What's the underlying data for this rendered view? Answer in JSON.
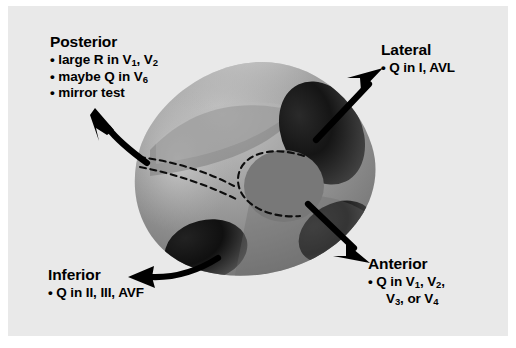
{
  "figure": {
    "background_color": "#e9e9e9",
    "frame_color": "#ffffff",
    "ink_color": "#000000"
  },
  "heart": {
    "name": "left-ventricle-cross-section",
    "body_color": "#8f8f8f",
    "highlight_color": "#c2c2c2",
    "shadow_color": "#141414",
    "cavity_color": "#767676",
    "dashed_line_color": "#111111",
    "shadow_regions": [
      "lateral-wall-shadow",
      "anterior-wall-shadow",
      "inferior-wall-shadow"
    ],
    "cavity_label": "ventricular-cavity"
  },
  "regions": [
    {
      "id": "posterior",
      "heading": "Posterior",
      "bullets": [
        {
          "prefix": "large R in V",
          "sub1": "1",
          "mid": ", V",
          "sub2": "2",
          "suffix": ""
        },
        {
          "prefix": "maybe Q in V",
          "sub1": "6",
          "mid": "",
          "sub2": "",
          "suffix": ""
        },
        {
          "prefix": "mirror test",
          "sub1": "",
          "mid": "",
          "sub2": "",
          "suffix": ""
        }
      ],
      "arrow": "curved-arrow-up-left"
    },
    {
      "id": "lateral",
      "heading": "Lateral",
      "bullets": [
        {
          "prefix": "Q in I, AVL",
          "sub1": "",
          "mid": "",
          "sub2": "",
          "suffix": ""
        }
      ],
      "arrow": "straight-arrow-up-right"
    },
    {
      "id": "anterior",
      "heading": "Anterior",
      "bullets": [
        {
          "prefix": "Q in V",
          "sub1": "1",
          "mid": ", V",
          "sub2": "2",
          "suffix": ","
        },
        {
          "prefix": "V",
          "sub1": "3",
          "mid": ", or V",
          "sub2": "4",
          "suffix": ""
        }
      ],
      "arrow": "straight-arrow-down-right"
    },
    {
      "id": "inferior",
      "heading": "Inferior",
      "bullets": [
        {
          "prefix": "Q in II, III, AVF",
          "sub1": "",
          "mid": "",
          "sub2": "",
          "suffix": ""
        }
      ],
      "arrow": "curved-arrow-left"
    }
  ],
  "text": {
    "posterior_heading": "Posterior",
    "posterior_b1a": "large R in V",
    "posterior_b1s1": "1",
    "posterior_b1m": ", V",
    "posterior_b1s2": "2",
    "posterior_b2a": "maybe Q in V",
    "posterior_b2s1": "6",
    "posterior_b3": "mirror test",
    "lateral_heading": "Lateral",
    "lateral_b1": "Q in I, AVL",
    "anterior_heading": "Anterior",
    "anterior_b1a": "Q in V",
    "anterior_b1s1": "1",
    "anterior_b1m": ", V",
    "anterior_b1s2": "2",
    "anterior_b1end": ",",
    "anterior_b2a": "V",
    "anterior_b2s1": "3",
    "anterior_b2m": ", or V",
    "anterior_b2s2": "4",
    "inferior_heading": "Inferior",
    "inferior_b1": "Q in II, III, AVF",
    "bullet": "•"
  }
}
